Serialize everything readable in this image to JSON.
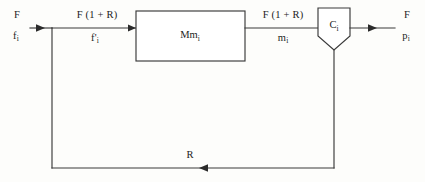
{
  "diagram": {
    "type": "block-flow-diagram",
    "blocks": [
      {
        "id": "mixer-block",
        "shape": "rectangle",
        "label_main": "Mm",
        "label_sub": "i"
      },
      {
        "id": "separator-block",
        "shape": "pentagon-down",
        "label_main": "C",
        "label_sub": "i"
      }
    ],
    "streams": [
      {
        "id": "feed-stream",
        "position": "left-input",
        "line1_main": "F",
        "line1_sub": "",
        "line2_main": "f",
        "line2_sub": "i"
      },
      {
        "id": "combined-feed-stream",
        "position": "before-mixer",
        "line1_main": "F (1 + R)",
        "line1_sub": "",
        "line2_main": "f'",
        "line2_sub": "i"
      },
      {
        "id": "mixer-outlet-stream",
        "position": "after-mixer",
        "line1_main": "F (1 + R)",
        "line1_sub": "",
        "line2_main": "m",
        "line2_sub": "i"
      },
      {
        "id": "product-stream",
        "position": "right-output",
        "line1_main": "F",
        "line1_sub": "",
        "line2_main": "p",
        "line2_sub": "i"
      },
      {
        "id": "recycle-stream",
        "position": "bottom-feedback",
        "line1_main": "R",
        "line1_sub": "",
        "line2_main": "",
        "line2_sub": ""
      }
    ],
    "colors": {
      "line": "#3a3a3a",
      "text": "#1c1c1c",
      "background": "#fdfdfb",
      "shape_fill": "#ffffff"
    }
  }
}
